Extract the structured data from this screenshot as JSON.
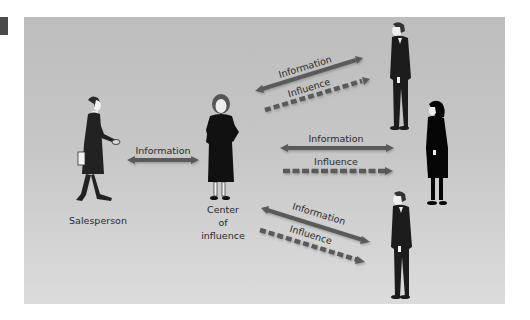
{
  "diagram": {
    "nodes": {
      "salesperson": {
        "label": "Salesperson"
      },
      "center": {
        "label_line1": "Center",
        "label_line2": "of",
        "label_line3": "influence"
      },
      "prospect_top": {
        "label": ""
      },
      "prospect_middle": {
        "label": ""
      },
      "prospect_bottom": {
        "label": ""
      }
    },
    "edges": {
      "sales_to_center": {
        "label": "Information",
        "style": "solid",
        "direction": "bidirectional"
      },
      "center_to_top_info": {
        "label": "Information",
        "style": "solid",
        "direction": "bidirectional"
      },
      "center_to_top_influence": {
        "label": "Influence",
        "style": "dashed",
        "direction": "to-prospect"
      },
      "center_to_middle_info": {
        "label": "Information",
        "style": "solid",
        "direction": "bidirectional"
      },
      "center_to_middle_influence": {
        "label": "Influence",
        "style": "dashed",
        "direction": "to-prospect"
      },
      "center_to_bottom_info": {
        "label": "Information",
        "style": "solid",
        "direction": "bidirectional"
      },
      "center_to_bottom_influence": {
        "label": "Influence",
        "style": "dashed",
        "direction": "to-prospect"
      }
    },
    "colors": {
      "background_top": "#bdbdbd",
      "background_bottom": "#dcdcdc",
      "arrow": "#5a5a5a",
      "figure": "#1a1a1a",
      "text": "#2a2a2a"
    }
  }
}
